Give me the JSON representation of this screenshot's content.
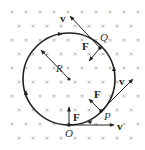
{
  "diagram": {
    "field_symbol": "×",
    "field_color": "#9a9a9a",
    "line_color": "#222222",
    "circle": {
      "cx": 69,
      "cy": 79,
      "r": 46
    },
    "radius_label": "R",
    "points": [
      {
        "id": "O",
        "label": "O",
        "x": 69,
        "y": 125
      },
      {
        "id": "P",
        "label": "P",
        "x": 101,
        "y": 111
      },
      {
        "id": "Q",
        "label": "Q",
        "x": 100,
        "y": 48
      }
    ],
    "vectors": [
      {
        "at": "O",
        "type": "velocity",
        "label": "v"
      },
      {
        "at": "O",
        "type": "force",
        "label": "F"
      },
      {
        "at": "P",
        "type": "velocity",
        "label": "v"
      },
      {
        "at": "P",
        "type": "force",
        "label": "F"
      },
      {
        "at": "Q",
        "type": "velocity",
        "label": "v"
      },
      {
        "at": "Q",
        "type": "force",
        "label": "F"
      }
    ],
    "direction": "counterclockwise"
  }
}
